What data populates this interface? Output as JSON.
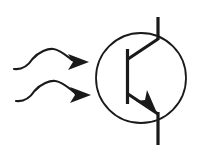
{
  "figure": {
    "background_color": "#ffffff",
    "ink_color": "#1a1a1a",
    "width": 199,
    "height": 158
  },
  "symbol": {
    "device_name": "phototransistor",
    "device_type": "NPN bipolar junction transistor, light sensitive",
    "envelope": {
      "name": "transistor envelope circle",
      "center_x": 141,
      "center_y": 78,
      "radius": 45,
      "stroke_width": 1.8
    },
    "base": {
      "name": "base bar",
      "x": 127.5,
      "y_top": 49,
      "y_bottom": 104,
      "stroke_width": 3.2
    },
    "collector": {
      "name": "collector branch",
      "diagonal_from_x": 128,
      "diagonal_from_y": 59,
      "diagonal_to_x": 158,
      "diagonal_to_y": 39,
      "lead_x": 158,
      "lead_y_top": 17,
      "lead_y_bottom": 40,
      "stroke_width": 3.2
    },
    "emitter": {
      "name": "emitter branch with arrowhead",
      "diagonal_from_x": 128,
      "diagonal_from_y": 94,
      "diagonal_to_x": 158,
      "diagonal_to_y": 114,
      "lead_x": 158,
      "lead_y_top": 112,
      "lead_y_bottom": 145,
      "arrow_tip_x": 155,
      "arrow_tip_y": 110,
      "stroke_width": 3.2
    }
  },
  "light_rays": [
    {
      "name": "upper light ray",
      "label": "incident light ray 1",
      "start_x": 14,
      "start_y": 69,
      "end_x": 88,
      "end_y": 62,
      "arrow_tip_x": 89,
      "arrow_tip_y": 62,
      "stroke_width": 2.2
    },
    {
      "name": "lower light ray",
      "label": "incident light ray 2",
      "start_x": 16,
      "start_y": 101,
      "end_x": 90,
      "end_y": 95,
      "arrow_tip_x": 91,
      "arrow_tip_y": 95,
      "stroke_width": 2.2
    }
  ],
  "accessible": {
    "description": "Phototransistor symbol: an NPN transistor inside a circle with two wavy arrows pointing at it representing incoming light."
  }
}
